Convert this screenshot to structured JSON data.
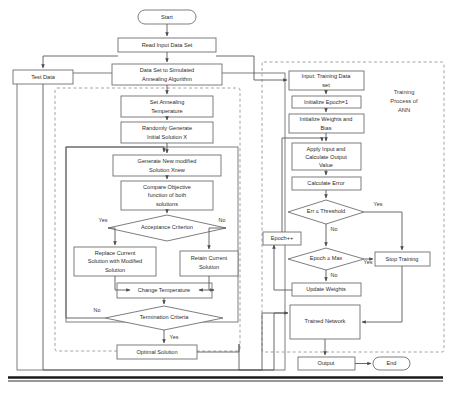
{
  "diagram": {
    "groups": [
      {
        "id": "sa_group",
        "label": ""
      },
      {
        "id": "ann_group",
        "label": "Training Process of ANN"
      }
    ],
    "group_labels": {
      "ann_line1": "Training",
      "ann_line2": "Process of",
      "ann_line3": "ANN"
    },
    "nodes": {
      "start": {
        "label": "Start",
        "shape": "terminator"
      },
      "read_input": {
        "label": "Read Input Data Set",
        "shape": "process"
      },
      "test_data": {
        "label": "Test Data",
        "shape": "process"
      },
      "dataset_to_sa_l1": {
        "label": "Data Set to Simulated",
        "shape": "process"
      },
      "dataset_to_sa_l2": {
        "label": "Annealing Algorithm",
        "shape": "process"
      },
      "set_temp_l1": {
        "label": "Set Annealing",
        "shape": "process"
      },
      "set_temp_l2": {
        "label": "Temperature",
        "shape": "process"
      },
      "rand_gen_l1": {
        "label": "Randomly Generate",
        "shape": "process"
      },
      "rand_gen_l2": {
        "label": "Initial Solution X",
        "shape": "process"
      },
      "gen_new_l1": {
        "label": "Generate  New modified",
        "shape": "process"
      },
      "gen_new_l2": {
        "label": "Solution Xnew",
        "shape": "process"
      },
      "compare_l1": {
        "label": "Compare Objective",
        "shape": "process"
      },
      "compare_l2": {
        "label": "function of both",
        "shape": "process"
      },
      "compare_l3": {
        "label": "solutions",
        "shape": "process"
      },
      "acceptance": {
        "label": "Acceptance Criterion",
        "shape": "decision"
      },
      "replace_l1": {
        "label": "Replace Current",
        "shape": "process"
      },
      "replace_l2": {
        "label": "Solution with Modified",
        "shape": "process"
      },
      "replace_l3": {
        "label": "Solution",
        "shape": "process"
      },
      "retain_l1": {
        "label": "Retain Current",
        "shape": "process"
      },
      "retain_l2": {
        "label": "Solution",
        "shape": "process"
      },
      "change_temp": {
        "label": "Change Temperature",
        "shape": "process"
      },
      "termination": {
        "label": "Termination Criteria",
        "shape": "decision"
      },
      "optimal": {
        "label": "Optimal Solution",
        "shape": "process"
      },
      "input_train_l1": {
        "label": "Input: Training Data",
        "shape": "process"
      },
      "input_train_l2": {
        "label": "set",
        "shape": "process"
      },
      "init_epoch": {
        "label": "Initialize Epoch=1",
        "shape": "process"
      },
      "init_weights_l1": {
        "label": "Initialize Weights and",
        "shape": "process"
      },
      "init_weights_l2": {
        "label": "Bias",
        "shape": "process"
      },
      "apply_input_l1": {
        "label": "Apply Input and",
        "shape": "process"
      },
      "apply_input_l2": {
        "label": "Calculate Output",
        "shape": "process"
      },
      "apply_input_l3": {
        "label": "Value",
        "shape": "process"
      },
      "calc_error": {
        "label": "Calculate Error",
        "shape": "process"
      },
      "err_threshold": {
        "label": "Err ≤ Threshold",
        "shape": "decision"
      },
      "epoch_inc": {
        "label": "Epoch++",
        "shape": "process"
      },
      "epoch_max": {
        "label": "Epoch ≥ Max",
        "shape": "decision"
      },
      "stop_training": {
        "label": "Stop Training",
        "shape": "process"
      },
      "update_weights": {
        "label": "Update Weights",
        "shape": "process"
      },
      "trained_network": {
        "label": "Trained Network",
        "shape": "process"
      },
      "output": {
        "label": "Output",
        "shape": "process"
      },
      "end": {
        "label": "End",
        "shape": "terminator"
      }
    },
    "edge_labels": {
      "acceptance_yes": "Yes",
      "acceptance_no": "No",
      "termination_no": "No",
      "termination_yes": "Yes",
      "err_yes": "Yes",
      "err_no": "No",
      "epoch_yes": "Yes",
      "epoch_no": "No"
    },
    "colors": {
      "node_stroke": "#6f6f6f",
      "node_fill": "#ffffff",
      "flow_stroke": "#5a5a5a",
      "group_dash": "#9a9a9a",
      "text": "#2b2b2b",
      "rule": "#1a1a1a",
      "background": "#ffffff"
    }
  }
}
